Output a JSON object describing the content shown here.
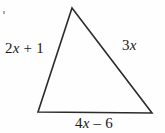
{
  "figure": {
    "type": "geometry-diagram",
    "shape": "triangle",
    "background_color": "#fefefe",
    "stroke_color": "#2b2b2b",
    "stroke_width": 1.6,
    "text_color": "#1a1a1a",
    "vertices": {
      "apex": {
        "x": 72,
        "y": 8
      },
      "bottom_left": {
        "x": 38,
        "y": 112
      },
      "bottom_right": {
        "x": 152,
        "y": 113
      }
    },
    "labels": {
      "left_side": {
        "coefficient": "2",
        "variable": "x",
        "operator": " + ",
        "constant": "1",
        "full": "2x + 1"
      },
      "right_side": {
        "coefficient": "3",
        "variable": "x",
        "operator": "",
        "constant": "",
        "full": "3x"
      },
      "bottom_side": {
        "coefficient": "4",
        "variable": "x",
        "operator": " – ",
        "constant": "6",
        "full": "4x – 6"
      }
    },
    "artifact": {
      "name": "scan-speck",
      "color": "#8d8d8d"
    }
  }
}
